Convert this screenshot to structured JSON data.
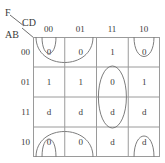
{
  "kmap": {
    "function_label": "F",
    "column_variable": "CD",
    "row_variable": "AB",
    "column_headers": [
      "00",
      "01",
      "11",
      "10"
    ],
    "row_headers": [
      "00",
      "01",
      "11",
      "10"
    ],
    "cells": [
      [
        "0",
        "0",
        "1",
        "0"
      ],
      [
        "1",
        "1",
        "0",
        "1"
      ],
      [
        "d",
        "d",
        "d",
        "d"
      ],
      [
        "0",
        "0",
        "d",
        "d"
      ]
    ],
    "colors": {
      "grid_line": "#9a9a9a",
      "loop_line": "#7d7d7d",
      "text": "#3a3a3a",
      "background": "#ffffff"
    },
    "groups": [
      {
        "name": "wrap-group-column-00",
        "shape": "vertical-wrap-narrow",
        "cells": [
          "AB=00,CD=00",
          "AB=10,CD=00"
        ]
      },
      {
        "name": "wrap-group-columns-00-01",
        "shape": "vertical-wrap-wide",
        "cells": [
          "AB=00,CD=00",
          "AB=00,CD=01",
          "AB=10,CD=00",
          "AB=10,CD=01"
        ]
      },
      {
        "name": "wrap-group-column-10",
        "shape": "vertical-wrap-narrow",
        "cells": [
          "AB=00,CD=10",
          "AB=10,CD=10"
        ]
      },
      {
        "name": "oval-group-column-11",
        "shape": "vertical-oval",
        "cells": [
          "AB=01,CD=11",
          "AB=11,CD=11"
        ]
      }
    ]
  }
}
